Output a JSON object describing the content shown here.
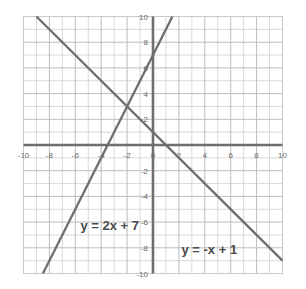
{
  "chart_data": {
    "type": "line",
    "title": "",
    "xlabel": "",
    "ylabel": "",
    "xlim": [
      -10,
      10
    ],
    "ylim": [
      -10,
      10
    ],
    "grid": true,
    "grid_step": 1,
    "tick_step": 2,
    "legend": "inline-annotations",
    "x_ticks": [
      -10,
      -8,
      -6,
      -4,
      -2,
      0,
      2,
      4,
      6,
      8,
      10
    ],
    "y_ticks": [
      -10,
      -8,
      -6,
      -4,
      -2,
      0,
      2,
      4,
      6,
      8,
      10
    ],
    "x_tick_labels": [
      "-10",
      "-8",
      "-6",
      "-4",
      "-2",
      "0",
      "2",
      "4",
      "6",
      "8",
      "10"
    ],
    "y_tick_labels": [
      "-10",
      "-8",
      "-6",
      "-4",
      "-2",
      "0",
      "2",
      "4",
      "6",
      "8",
      "10"
    ],
    "series": [
      {
        "name": "y = 2x + 7",
        "equation": "y = 2x + 7",
        "slope": 2,
        "intercept": 7,
        "color": "#6e6e6e",
        "points": [
          [
            -8.5,
            -10
          ],
          [
            10,
            10
          ]
        ],
        "x_intercept": -3.5,
        "y_intercept": 7
      },
      {
        "name": "y = -x + 1",
        "equation": "y = -x + 1",
        "slope": -1,
        "intercept": 1,
        "color": "#6e6e6e",
        "points": [
          [
            -9,
            10
          ],
          [
            10,
            -9
          ]
        ],
        "x_intercept": 1,
        "y_intercept": 1
      }
    ],
    "intersection": [
      -2,
      3
    ],
    "annotations": [
      {
        "text": "y = 2x + 7",
        "x": -5.6,
        "y": -6.6
      },
      {
        "text": "y = -x + 1",
        "x": 2.2,
        "y": -8.5
      }
    ],
    "colors": {
      "background": "#ffffff",
      "grid_minor": "#d9d9d9",
      "grid_major": "#bdbdbd",
      "axis": "#6e6e6e",
      "line": "#6e6e6e",
      "tick_text": "#6b6b6b",
      "equation_text": "#4a4a4a",
      "border": "#c9c9c9"
    }
  }
}
